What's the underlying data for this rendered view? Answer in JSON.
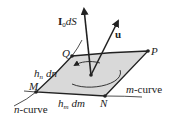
{
  "diagram": {
    "labels": {
      "current_vector": "I",
      "current_sub": "0",
      "current_tail": "dS",
      "velocity_vector": "u",
      "point_q": "Q",
      "point_p": "P",
      "point_m": "M",
      "point_n": "N",
      "side_n_h": "h",
      "side_n_sub": "n",
      "side_n_d": "dn",
      "side_m_h": "h",
      "side_m_sub": "m",
      "side_m_d": "dm",
      "n_curve_var": "n",
      "n_curve_text": "-curve",
      "m_curve_var": "m",
      "m_curve_text": "-curve"
    },
    "colors": {
      "surface_fill": "#d9d9d9",
      "stroke": "#222222"
    }
  }
}
